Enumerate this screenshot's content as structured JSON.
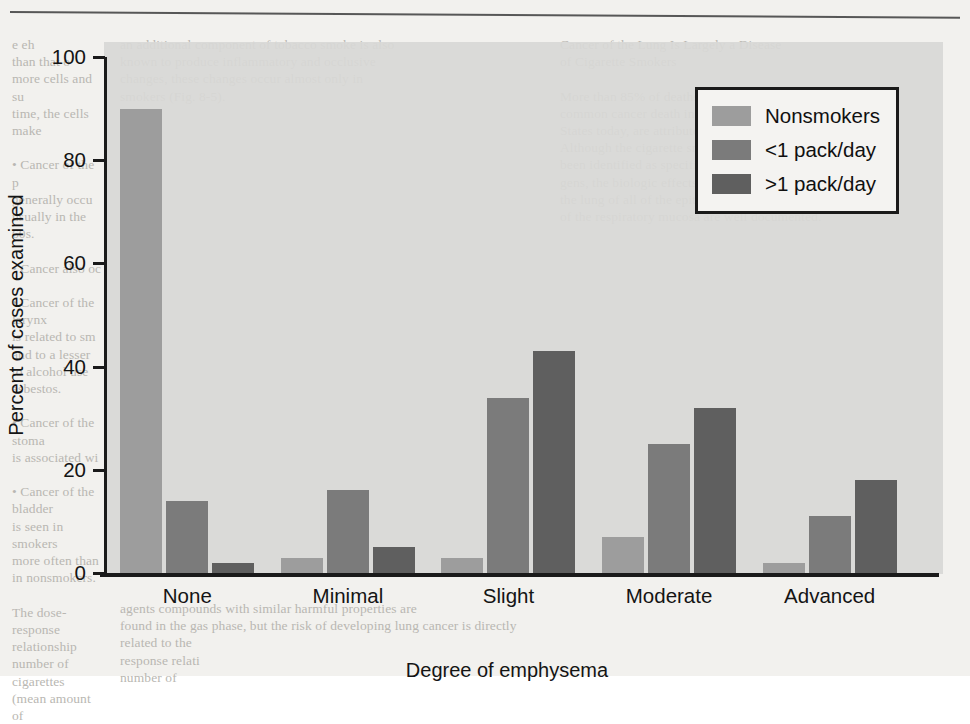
{
  "chart_data": {
    "type": "bar",
    "title": "",
    "xlabel": "Degree of emphysema",
    "ylabel": "Percent of cases examined",
    "ylim": [
      0,
      100
    ],
    "yticks": [
      0,
      20,
      40,
      60,
      80,
      100
    ],
    "grid": false,
    "legend_position": "upper right",
    "categories": [
      "None",
      "Minimal",
      "Slight",
      "Moderate",
      "Advanced"
    ],
    "series": [
      {
        "name": "Nonsmokers",
        "color": "#9d9d9d",
        "values": [
          90,
          3,
          3,
          7,
          2
        ]
      },
      {
        "name": "<1 pack/day",
        "color": "#7b7b7b",
        "values": [
          14,
          16,
          34,
          25,
          11
        ]
      },
      {
        "name": ">1 pack/day",
        "color": "#5f5f5f",
        "values": [
          2,
          5,
          43,
          32,
          18
        ]
      }
    ]
  },
  "legend": {
    "items": [
      {
        "label": "Nonsmokers"
      },
      {
        "label": "<1 pack/day"
      },
      {
        "label": ">1 pack/day"
      }
    ]
  },
  "page_background": {
    "left_column_top": "e eh\nthan that o\nmore cells and su\ntime, the cells make\n\n• Cancer of the p\ngenerally occu\nusually in the\n60s.\n\n• Cancer also oc\n\n• Cancer of the larynx\nis related to sm\nand to a lesser\nto alcohol use\nasbestos.\n\n• Cancer of the stoma\nis associated wi\n\n• Cancer of the bladder\nis seen in smokers\nmore often than\nin nonsmokers.\n\nThe dose-\nresponse relationship\nnumber of cigarettes\n(mean amount of",
    "middle_column_top": "an additional component of tobacco smoke is also\nknown to produce inflammatory and occlusive\nchanges, these changes occur almost only in\nsmokers (Fig. 8-5).",
    "right_column_top": "Cancer of the Lung Is Largely a Disease\nof Cigarette Smokers\n\nMore than 85% of deaths from lung cancer, the single most\ncommon cancer death in both men and women in the United\nStates today, are attributed to cigarette smoking (Fig. 8-6).\nAlthough the cigarette smokers themselves are not have not\nbeen identified as specific mutagens and carcino-\ngens, the biologic effects of cigarette smoke on\nthe lung of all of the epithelial surfaces and on all cells\nof the respiratory mucosa are well documented.",
    "bottom_strip": "agents compounds with similar harmful properties are\nfound in the gas phase, but the risk of developing lung cancer is directly related to the\nresponse relati\nnumber of"
  }
}
